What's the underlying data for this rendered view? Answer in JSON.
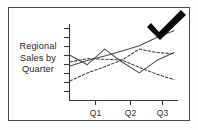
{
  "image": {
    "kind": "clipart-line-chart",
    "frame_border_color": "#4a4a4a",
    "background_color": "#ffffff"
  },
  "caption": {
    "name": "chart-caption",
    "line1": "Regional",
    "line2": "Sales by",
    "line3": "Quarter",
    "full_text": "Regional Sales by Quarter"
  },
  "overlay": {
    "checkmark": {
      "name": "checkmark-icon",
      "color": "#0a0a0a",
      "label": "check"
    }
  },
  "chart_data": {
    "type": "line",
    "title": "Regional Sales by Quarter",
    "xlabel": "",
    "ylabel": "",
    "grid": false,
    "legend": "none",
    "x": [
      0,
      1,
      2,
      3,
      4,
      5,
      6
    ],
    "categories": [
      "",
      "Q1",
      "",
      "Q2",
      "",
      "Q3",
      ""
    ],
    "tick_labels_x": [
      "Q1",
      "Q2",
      "Q3"
    ],
    "tick_labels_y": [],
    "y_tick_count": 8,
    "ylim": [
      0,
      10
    ],
    "xlim": [
      0,
      6
    ],
    "series": [
      {
        "name": "series-1",
        "style": "solid",
        "values": [
          6.0,
          4.6,
          6.9,
          5.0,
          3.4,
          5.2,
          6.4
        ]
      },
      {
        "name": "series-2",
        "style": "solid",
        "values": [
          4.4,
          5.2,
          5.9,
          6.6,
          7.4,
          8.6,
          9.6
        ]
      },
      {
        "name": "series-3",
        "style": "dashed",
        "values": [
          2.2,
          3.4,
          4.3,
          5.3,
          6.9,
          6.4,
          6.2
        ]
      },
      {
        "name": "series-4",
        "style": "dashed",
        "values": [
          5.0,
          5.5,
          5.4,
          5.3,
          4.2,
          3.2,
          2.4
        ]
      }
    ]
  },
  "axes": {
    "x_axis_name": "x-axis",
    "y_axis_name": "y-axis",
    "tick_marks_y": 8,
    "tick_marks_x": 3
  }
}
